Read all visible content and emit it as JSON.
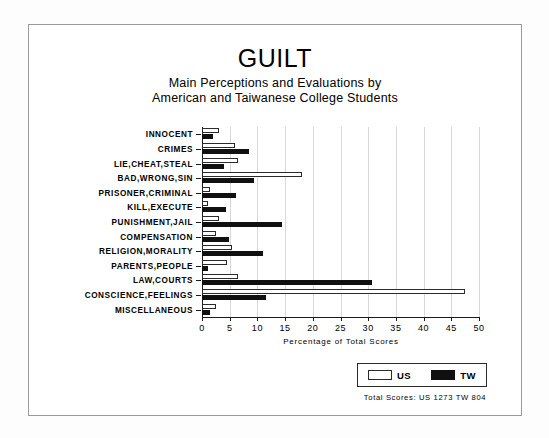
{
  "figure": {
    "title": "GUILT",
    "subtitle_line1": "Main Perceptions and Evaluations by",
    "subtitle_line2": "American and Taiwanese College Students"
  },
  "legend": {
    "us_label": "US",
    "tw_label": "TW"
  },
  "totals_note": "Total Scores:  US 1273   TW 804",
  "colors": {
    "us_fill": "#ffffff",
    "tw_fill": "#101010",
    "outline": "#2b2b2b",
    "grid": "#d8d8d8",
    "axis": "#1a1a1a"
  },
  "chart_data": {
    "type": "bar",
    "orientation": "horizontal",
    "title": "GUILT",
    "subtitle": "Main Perceptions and Evaluations by American and Taiwanese College Students",
    "xlabel": "Percentage of Total Scores",
    "ylabel": "",
    "xlim": [
      0,
      50
    ],
    "xticks": [
      0,
      5,
      10,
      15,
      20,
      25,
      30,
      35,
      40,
      45,
      50
    ],
    "xtick_labels": [
      "0",
      "5",
      "10",
      "15",
      "20",
      "25",
      "30",
      "35",
      "40",
      "45",
      "50"
    ],
    "grid": true,
    "legend_position": "bottom-right",
    "categories": [
      "INNOCENT",
      "CRIMES",
      "LIE,CHEAT,STEAL",
      "BAD,WRONG,SIN",
      "PRISONER,CRIMINAL",
      "KILL,EXECUTE",
      "PUNISHMENT,JAIL",
      "COMPENSATION",
      "RELIGION,MORALITY",
      "PARENTS,PEOPLE",
      "LAW,COURTS",
      "CONSCIENCE,FEELINGS",
      "MISCELLANEOUS"
    ],
    "series": [
      {
        "name": "US",
        "values": [
          3.0,
          6.0,
          6.5,
          18.0,
          1.5,
          1.0,
          3.0,
          2.5,
          5.5,
          4.5,
          6.5,
          47.5,
          2.5
        ]
      },
      {
        "name": "TW",
        "values": [
          2.0,
          8.5,
          4.0,
          9.4,
          6.2,
          4.4,
          14.5,
          4.8,
          11.0,
          1.0,
          30.7,
          11.5,
          1.5
        ]
      }
    ],
    "annotations": [
      "Total Scores:  US 1273   TW 804"
    ]
  }
}
